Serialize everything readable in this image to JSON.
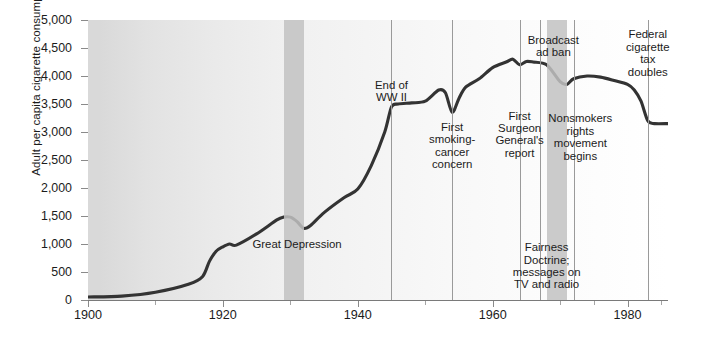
{
  "chart_data": {
    "type": "line",
    "title": "",
    "xlabel": "",
    "ylabel": "Adult per capita cigarette consumption",
    "xlim": [
      1900,
      1986
    ],
    "ylim": [
      0,
      5000
    ],
    "grid": false,
    "legend": "none",
    "xticks": [
      1900,
      1920,
      1940,
      1960,
      1980
    ],
    "xticklabels": [
      "1900",
      "1920",
      "1940",
      "1960",
      "1980"
    ],
    "xtick_minor": [
      1910,
      1930,
      1950,
      1970,
      1975,
      1985
    ],
    "yticks": [
      0,
      500,
      1000,
      1500,
      2000,
      2500,
      3000,
      3500,
      4000,
      4500,
      5000
    ],
    "yticklabels": [
      "0",
      "500",
      "1,000",
      "1,500",
      "2,000",
      "2,500",
      "3,000",
      "3,500",
      "4,000",
      "4,500",
      "5,000"
    ],
    "series": [
      {
        "name": "Adult per capita cigarette consumption",
        "color": "#333333",
        "x": [
          1900,
          1905,
          1910,
          1915,
          1917,
          1918,
          1919,
          1920,
          1921,
          1922,
          1925,
          1928,
          1929,
          1930,
          1931,
          1932,
          1933,
          1935,
          1938,
          1940,
          1942,
          1944,
          1945,
          1946,
          1948,
          1950,
          1952,
          1953,
          1954,
          1955,
          1956,
          1958,
          1960,
          1962,
          1963,
          1964,
          1965,
          1966,
          1968,
          1970,
          1971,
          1972,
          1974,
          1976,
          1978,
          1980,
          1981,
          1982,
          1983,
          1984,
          1986
        ],
        "y": [
          54,
          70,
          138,
          285,
          420,
          690,
          870,
          950,
          1000,
          980,
          1180,
          1430,
          1480,
          1480,
          1400,
          1280,
          1330,
          1560,
          1830,
          1980,
          2400,
          3000,
          3450,
          3500,
          3520,
          3550,
          3750,
          3700,
          3350,
          3600,
          3800,
          3950,
          4150,
          4250,
          4300,
          4200,
          4260,
          4250,
          4200,
          3900,
          3850,
          3950,
          4000,
          3980,
          3920,
          3850,
          3750,
          3550,
          3200,
          3150,
          3150
        ],
        "ymax_peak": 4300,
        "start_value": 54,
        "end_value": 3150
      }
    ],
    "shaded_bands": [
      {
        "label": "Great Depression",
        "start": 1929,
        "end": 1932,
        "color": "#c2c2c2"
      },
      {
        "label": "Broadcast ad ban",
        "start": 1968,
        "end": 1971,
        "color": "#c2c2c2"
      }
    ],
    "event_lines": [
      {
        "year": 1945,
        "label": "End of\nWW II"
      },
      {
        "year": 1954,
        "label": "First\nsmoking-\ncancer\nconcern"
      },
      {
        "year": 1964,
        "label": "First\nSurgeon\nGeneral's\nreport"
      },
      {
        "year": 1967,
        "label": "Fairness\nDoctrine;\nmessages on\nTV and radio"
      },
      {
        "year": 1972,
        "label": "Nonsmokers\nrights\nmovement\nbegins"
      },
      {
        "year": 1983,
        "label": "Federal\ncigarette\ntax\ndoubles"
      }
    ],
    "annotations": [
      {
        "text": "Great Depression",
        "x": 1931,
        "y": 1100,
        "position": "in-band"
      },
      {
        "text": "End of\nWW II",
        "x": 1945,
        "y": 3950,
        "position": "above-line"
      },
      {
        "text": "First\nsmoking-\ncancer\nconcern",
        "x": 1954,
        "y": 3200,
        "position": "below-line"
      },
      {
        "text": "First\nSurgeon\nGeneral's\nreport",
        "x": 1964,
        "y": 3400,
        "position": "below-line"
      },
      {
        "text": "Broadcast\nad ban",
        "x": 1969,
        "y": 4750,
        "position": "top"
      },
      {
        "text": "Nonsmokers\nrights\nmovement\nbegins",
        "x": 1973,
        "y": 3350,
        "position": "below-line"
      },
      {
        "text": "Fairness\nDoctrine;\nmessages on\nTV and radio",
        "x": 1968,
        "y": 1050,
        "position": "bottom"
      },
      {
        "text": "Federal\ncigarette\ntax\ndoubles",
        "x": 1983,
        "y": 4850,
        "position": "top"
      }
    ]
  },
  "axis": {
    "y_title": "Adult per capita cigarette consumption",
    "y_labels": [
      "5,000",
      "4,500",
      "4,000",
      "3,500",
      "3,000",
      "2,500",
      "2,000",
      "1,500",
      "1,000",
      "500",
      "0"
    ],
    "x_labels": [
      "1900",
      "1920",
      "1940",
      "1960",
      "1980"
    ]
  },
  "labels": {
    "great_depression": "Great Depression",
    "end_of_ww2": "End of\nWW II",
    "first_smoking_cancer": "First\nsmoking-\ncancer\nconcern",
    "surgeon_general": "First\nSurgeon\nGeneral's\nreport",
    "broadcast_ad_ban": "Broadcast\nad ban",
    "nonsmokers_rights": "Nonsmokers\nrights\nmovement\nbegins",
    "fairness_doctrine": "Fairness\nDoctrine;\nmessages on\nTV and radio",
    "federal_tax": "Federal\ncigarette\ntax\ndoubles"
  },
  "colors": {
    "line": "#333333",
    "band": "#c2c2c2",
    "vline": "#9a9a9a",
    "text": "#1b1b1b",
    "axis": "#7a7a7a"
  }
}
